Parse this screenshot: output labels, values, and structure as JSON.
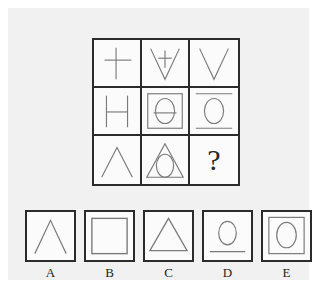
{
  "puzzle": {
    "type": "matrix-reasoning",
    "title": "3x3 visual analogy matrix with five answer options",
    "missing_cell_marker": "?",
    "colors": {
      "page_background": "#ffffff",
      "panel_background": "#f1f1f1",
      "cell_background": "#fbfbfb",
      "border": "#2b2b2b",
      "figure_stroke": "#6e6e6e",
      "label_text": "#1d1d1d"
    }
  },
  "matrix": {
    "rows": 3,
    "columns": 3,
    "cells": [
      {
        "position": "row1-col1",
        "figure": "cross",
        "description": "plus sign / cross"
      },
      {
        "position": "row1-col2",
        "figure": "v-with-cross",
        "description": "open V shape with small cross inside"
      },
      {
        "position": "row1-col3",
        "figure": "v-shape",
        "description": "open V shape"
      },
      {
        "position": "row2-col1",
        "figure": "h-letter",
        "description": "letter H made of two verticals and a crossbar"
      },
      {
        "position": "row2-col2",
        "figure": "square-with-theta",
        "description": "square frame containing an ellipse crossed by a horizontal bar"
      },
      {
        "position": "row2-col3",
        "figure": "ellipse-between-lines",
        "description": "ellipse with a horizontal line above and below"
      },
      {
        "position": "row3-col1",
        "figure": "caret",
        "description": "open triangle / caret, two strokes meeting at apex"
      },
      {
        "position": "row3-col2",
        "figure": "triangle-with-ellipse",
        "description": "closed triangle containing an ellipse"
      },
      {
        "position": "row3-col3",
        "figure": "question-mark",
        "description": "missing element marked with a question mark"
      }
    ]
  },
  "options": [
    {
      "label": "A",
      "figure": "caret",
      "description": "open caret / inverted V"
    },
    {
      "label": "B",
      "figure": "square",
      "description": "plain square outline"
    },
    {
      "label": "C",
      "figure": "triangle",
      "description": "closed triangle with baseline"
    },
    {
      "label": "D",
      "figure": "ellipse-over-line",
      "description": "ellipse above a horizontal line"
    },
    {
      "label": "E",
      "figure": "square-with-ellipse",
      "description": "square frame containing an ellipse"
    }
  ]
}
